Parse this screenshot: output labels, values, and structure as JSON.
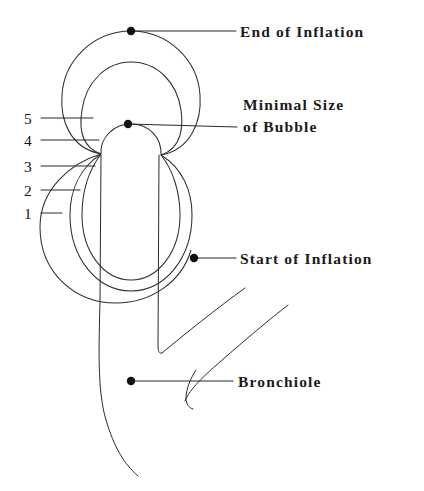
{
  "figure": {
    "background_color": "#ffffff",
    "ink_color": "#2b2b2b"
  },
  "callouts": [
    {
      "id": "end-of-inflation",
      "label": "End of Inflation",
      "label_line_1": "End of Inflation",
      "label_line_2": "",
      "dot": {
        "x": 131,
        "y": 31
      },
      "leader_end": {
        "x": 236,
        "y": 31
      },
      "text_x": 240,
      "text_y": 21
    },
    {
      "id": "minimal-size-of-bubble",
      "label": "Minimal Size of Bubble",
      "label_line_1": "Minimal Size",
      "label_line_2": "of Bubble",
      "dot": {
        "x": 128,
        "y": 124
      },
      "leader_end": {
        "x": 237,
        "y": 127
      },
      "text_x": 243,
      "text_y": 94
    },
    {
      "id": "start-of-inflation",
      "label": "Start of Inflation",
      "label_line_1": "Start of Inflation",
      "label_line_2": "",
      "dot": {
        "x": 194,
        "y": 258
      },
      "leader_end": {
        "x": 236,
        "y": 258
      },
      "text_x": 240,
      "text_y": 248
    },
    {
      "id": "bronchiole",
      "label": "Bronchiole",
      "label_line_1": "Bronchiole",
      "label_line_2": "",
      "dot": {
        "x": 131,
        "y": 381
      },
      "leader_end": {
        "x": 233,
        "y": 381
      },
      "text_x": 238,
      "text_y": 371
    }
  ],
  "stage_markers": [
    {
      "number": "5",
      "text_x": 24,
      "text_y": 110,
      "leader_from": {
        "x": 41,
        "y": 118
      },
      "leader_to": {
        "x": 93,
        "y": 118
      }
    },
    {
      "number": "4",
      "text_x": 24,
      "text_y": 132,
      "leader_from": {
        "x": 41,
        "y": 140
      },
      "leader_to": {
        "x": 99,
        "y": 140
      }
    },
    {
      "number": "3",
      "text_x": 24,
      "text_y": 158,
      "leader_from": {
        "x": 41,
        "y": 166
      },
      "leader_to": {
        "x": 95,
        "y": 166
      }
    },
    {
      "number": "2",
      "text_x": 24,
      "text_y": 182,
      "leader_from": {
        "x": 41,
        "y": 190
      },
      "leader_to": {
        "x": 80,
        "y": 190
      }
    },
    {
      "number": "1",
      "text_x": 24,
      "text_y": 205,
      "leader_from": {
        "x": 41,
        "y": 213
      },
      "leader_to": {
        "x": 62,
        "y": 213
      }
    }
  ],
  "geometry": {
    "anchor_left": {
      "x": 101,
      "y": 154
    },
    "anchor_right": {
      "x": 161,
      "y": 155
    },
    "bubbles": [
      {
        "stage": "5",
        "cx": 131,
        "cy": 95,
        "r": 64
      },
      {
        "stage": "4",
        "cx": 131,
        "cy": 112,
        "r": 52
      },
      {
        "stage": "3",
        "cx": 131,
        "cy": 155,
        "r": 31
      },
      {
        "stage": "2",
        "cx": 131,
        "cy": 215,
        "r": 61
      },
      {
        "stage": "1",
        "cx": 116,
        "cy": 225,
        "r": 76
      }
    ],
    "tube_left_x": 101,
    "tube_right_x": 159,
    "tube_top_y": 155,
    "tube_v_bottom_y": 353,
    "tube_tail_end": {
      "x": 138,
      "y": 476
    }
  }
}
